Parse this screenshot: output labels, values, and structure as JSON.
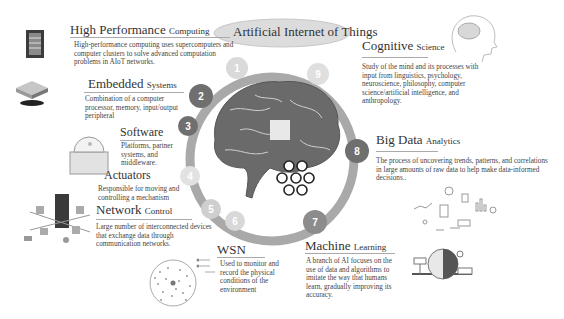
{
  "header": {
    "title": "Artificial Internet of Things"
  },
  "ring": {
    "numbers": [
      "1",
      "2",
      "3",
      "4",
      "5",
      "6",
      "7",
      "8",
      "9"
    ]
  },
  "sections": {
    "hpc": {
      "title_main": "High Performance",
      "title_small": "Computing",
      "desc": "High-performance computing uses supercomputers and computer clusters to solve advanced computation problems in AIoT networks.",
      "icon": "server-rack-icon"
    },
    "embedded": {
      "title_main": "Embedded",
      "title_small": "Systems",
      "desc": "Combination of a computer processor, memory, input/output peripheral",
      "icon": "chip-icon"
    },
    "software": {
      "title_main": "Software",
      "title_small": "",
      "desc": "Platforms, partner systems, and middleware.",
      "icon": "software-box-icon"
    },
    "actuators": {
      "title_main": "Actuators",
      "title_small": "",
      "desc": "Responsible for moving and controlling a mechanism"
    },
    "network": {
      "title_main": "Network",
      "title_small": "Control",
      "desc": "Large number of interconnected devices that exchange data through communication networks.",
      "icon": "network-city-icon"
    },
    "wsn": {
      "title_main": "WSN",
      "title_small": "",
      "desc": "Used to monitor and record the physical conditions of the environment",
      "icon": "sensor-network-icon"
    },
    "ml": {
      "title_main": "Machine",
      "title_small": "Learning",
      "desc": "A branch of AI focuses on the use of data and algorithms to imitate the way that humans learn, gradually improving its accuracy.",
      "icon": "ml-brain-icon"
    },
    "bigdata": {
      "title_main": "Big Data",
      "title_small": "Analytics",
      "desc": "The process of uncovering trends, patterns, and correlations in large amounts of raw data to help make data-informed decisions..",
      "icon": "analytics-icon"
    },
    "cognitive": {
      "title_main": "Cognitive",
      "title_small": "Science",
      "desc": "Study of the mind and its processes with input from linguistics, psychology, neuroscience, philosophy, computer science/artificial intelligence, and anthropology.",
      "icon": "head-brain-icon"
    }
  },
  "colors": {
    "ring": "#a9a9a9",
    "dark_node": "#6f6f6f",
    "light_node": "#d6d6d6",
    "title_ellipse": "#dcdcdc",
    "text": "#333333"
  }
}
